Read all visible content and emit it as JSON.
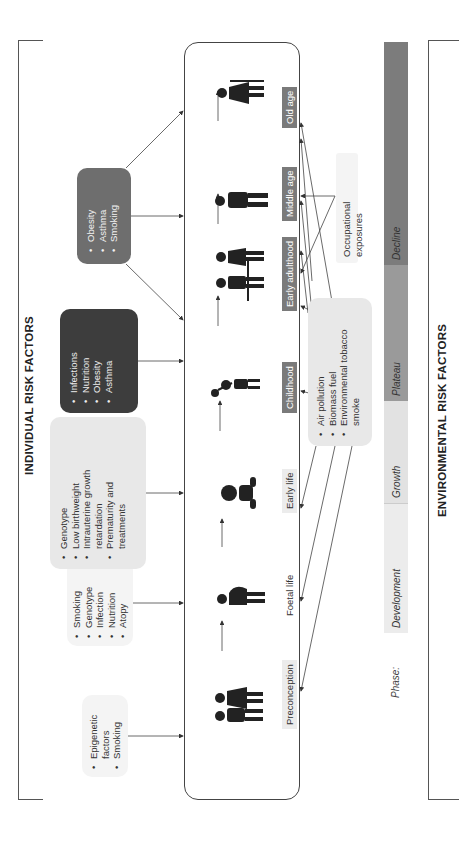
{
  "individual_title": "INDIVIDUAL RISK FACTORS",
  "environmental_title": "ENVIRONMENTAL RISK FACTORS",
  "stages": [
    {
      "label": "Preconception",
      "style": "light"
    },
    {
      "label": "Foetal life",
      "style": "none"
    },
    {
      "label": "Early life",
      "style": "light"
    },
    {
      "label": "Childhood",
      "style": "dark"
    },
    {
      "label": "Early adulthood",
      "style": "dark"
    },
    {
      "label": "Middle age",
      "style": "dark"
    },
    {
      "label": "Old age",
      "style": "dark"
    }
  ],
  "individual_boxes": [
    {
      "id": "preconception",
      "items": [
        "Epigenetic factors",
        "Smoking"
      ]
    },
    {
      "id": "foetal",
      "items": [
        "Smoking",
        "Genotype",
        "Infection",
        "Nutrition",
        "Atopy"
      ]
    },
    {
      "id": "early-life",
      "items": [
        "Genotype",
        "Low birthweight",
        "Intrauterine growth retardation",
        "Prematurity and treatments"
      ]
    },
    {
      "id": "childhood",
      "items": [
        "Infections",
        "Nutrition",
        "Obesity",
        "Asthma"
      ]
    },
    {
      "id": "adult",
      "items": [
        "Obesity",
        "Asthma",
        "Smoking"
      ]
    }
  ],
  "environmental_boxes": [
    {
      "id": "air",
      "items": [
        "Air pollution",
        "Biomass fuel",
        "Environmental tobacco smoke"
      ]
    },
    {
      "id": "occupational",
      "text": "Occupational exposures"
    }
  ],
  "phase_bar": {
    "label": "Phase:",
    "phases": [
      {
        "name": "Development",
        "color": "#ececec"
      },
      {
        "name": "Growth",
        "color": "#e2e2e2"
      },
      {
        "name": "Plateau",
        "color": "#9a9a9a"
      },
      {
        "name": "Decline",
        "color": "#7c7c7c"
      }
    ]
  }
}
